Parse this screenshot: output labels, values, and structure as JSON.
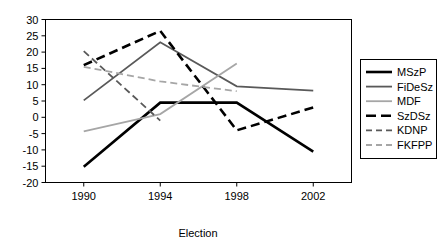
{
  "chart_data": {
    "type": "line",
    "title": "",
    "xlabel": "Election",
    "ylabel": "",
    "categories": [
      "1990",
      "1994",
      "1998",
      "2002"
    ],
    "x": [
      1990,
      1994,
      1998,
      2002
    ],
    "xlim": [
      1988,
      2004
    ],
    "ylim": [
      -20,
      30
    ],
    "yticks": [
      "30",
      "25",
      "20",
      "15",
      "10",
      "5",
      "0",
      "-5",
      "-10",
      "-15",
      "-20"
    ],
    "ytick_values": [
      30,
      25,
      20,
      15,
      10,
      5,
      0,
      -5,
      -10,
      -15,
      -20
    ],
    "xticks": [
      "1990",
      "1994",
      "1998",
      "2002"
    ],
    "grid": false,
    "legend_position": "right",
    "series": [
      {
        "name": "MSzP",
        "values": [
          -15.2,
          4.5,
          4.5,
          -10.5
        ],
        "x": [
          1990,
          1994,
          1998,
          2002
        ],
        "color": "#000000",
        "style": "solid",
        "width": 2.6
      },
      {
        "name": "FiDeSz",
        "values": [
          5.2,
          23.0,
          9.5,
          8.2
        ],
        "x": [
          1990,
          1994,
          1998,
          2002
        ],
        "color": "#595959",
        "style": "solid",
        "width": 1.8
      },
      {
        "name": "MDF",
        "values": [
          -4.3,
          1.0,
          16.5
        ],
        "x": [
          1990,
          1994,
          1998
        ],
        "color": "#a6a6a6",
        "style": "solid",
        "width": 1.8
      },
      {
        "name": "SzDSz",
        "values": [
          16.0,
          26.5,
          -4.0,
          3.0
        ],
        "x": [
          1990,
          1994,
          1998,
          2002
        ],
        "color": "#000000",
        "style": "dashed",
        "width": 2.6
      },
      {
        "name": "KDNP",
        "values": [
          20.3,
          -1.0
        ],
        "x": [
          1990,
          1994
        ],
        "color": "#595959",
        "style": "dashed",
        "width": 1.8
      },
      {
        "name": "FKFPP",
        "values": [
          15.5,
          11.0,
          8.0
        ],
        "x": [
          1990,
          1994,
          1998
        ],
        "color": "#a6a6a6",
        "style": "dashed",
        "width": 1.8
      }
    ]
  },
  "legend": {
    "items": [
      {
        "label": "MSzP"
      },
      {
        "label": "FiDeSz"
      },
      {
        "label": "MDF"
      },
      {
        "label": "SzDSz"
      },
      {
        "label": "KDNP"
      },
      {
        "label": "FKFPP"
      }
    ]
  },
  "axes": {
    "x_title": "Election"
  }
}
